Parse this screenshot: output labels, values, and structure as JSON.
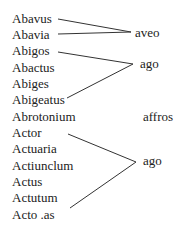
{
  "left_words": [
    {
      "text": "Abavus",
      "y": 11
    },
    {
      "text": "Abavia",
      "y": 27
    },
    {
      "text": "Abigos",
      "y": 43
    },
    {
      "text": "Abactus",
      "y": 60
    },
    {
      "text": "Abiges",
      "y": 76
    },
    {
      "text": "Abigeatus",
      "y": 92
    },
    {
      "text": "Abrotonium",
      "y": 109
    },
    {
      "text": "Actor",
      "y": 125
    },
    {
      "text": "Actuaria",
      "y": 141
    },
    {
      "text": "Actiunclum",
      "y": 158
    },
    {
      "text": "Actus",
      "y": 174
    },
    {
      "text": "Actutum",
      "y": 190
    },
    {
      "text": "Acto .as",
      "y": 207
    }
  ],
  "right_words": [
    {
      "text": "aveo",
      "x": 135,
      "y": 25
    },
    {
      "text": "ago",
      "x": 140,
      "y": 56
    },
    {
      "text": "affros",
      "x": 143,
      "y": 109
    },
    {
      "text": "ago",
      "x": 143,
      "y": 153
    }
  ],
  "lines": [
    [
      58,
      19,
      131,
      32
    ],
    [
      58,
      34,
      131,
      32
    ],
    [
      58,
      52,
      133,
      64
    ],
    [
      67,
      98,
      133,
      64
    ],
    [
      68,
      134,
      136,
      162
    ],
    [
      70,
      208,
      136,
      162
    ]
  ]
}
